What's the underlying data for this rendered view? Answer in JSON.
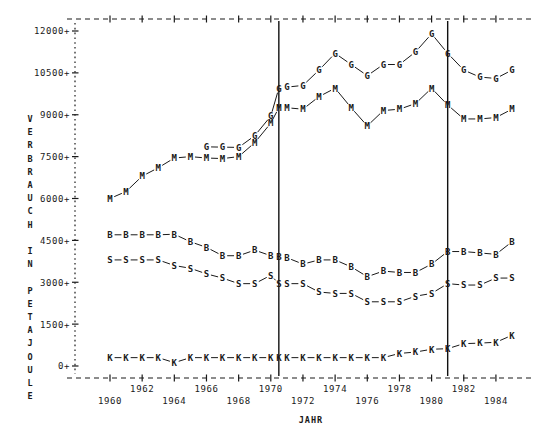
{
  "chart_data": {
    "type": "line",
    "title": "",
    "xlabel": "JAHR",
    "ylabel": "VERBRAUCH IN PETAJOULE",
    "xlim": [
      1959,
      1985.6
    ],
    "ylim": [
      0,
      12450
    ],
    "grid": false,
    "legend": "none",
    "marker_labels_as_series_keys": true,
    "y_ticks": [
      0,
      1500,
      3000,
      4500,
      6000,
      7500,
      9000,
      10500,
      12000
    ],
    "y_tick_labels": [
      "0+",
      "1500+",
      "3000+",
      "4500+",
      "6000+",
      "7500+",
      "9000+",
      "10500+",
      "12000+"
    ],
    "x_ticks": [
      1960,
      1961,
      1962,
      1963,
      1964,
      1965,
      1966,
      1967,
      1968,
      1969,
      1970,
      1971,
      1972,
      1973,
      1974,
      1975,
      1976,
      1977,
      1978,
      1979,
      1980,
      1981,
      1982,
      1983,
      1984,
      1985
    ],
    "x_tick_labels_upper": [
      {
        "year": 1962,
        "label": "1962"
      },
      {
        "year": 1966,
        "label": "1966"
      },
      {
        "year": 1970,
        "label": "1970"
      },
      {
        "year": 1974,
        "label": "1974"
      },
      {
        "year": 1978,
        "label": "1978"
      },
      {
        "year": 1982,
        "label": "1982"
      }
    ],
    "x_tick_labels_lower": [
      {
        "year": 1960,
        "label": "1960"
      },
      {
        "year": 1964,
        "label": "1964"
      },
      {
        "year": 1968,
        "label": "1968"
      },
      {
        "year": 1972,
        "label": "1972"
      },
      {
        "year": 1976,
        "label": "1976"
      },
      {
        "year": 1980,
        "label": "1980"
      },
      {
        "year": 1984,
        "label": "1984"
      }
    ],
    "reference_lines": [
      {
        "year": 1970.5,
        "label": ""
      },
      {
        "year": 1981.0,
        "label": ""
      }
    ],
    "series": [
      {
        "name": "G",
        "marker": "G",
        "x": [
          1966,
          1967,
          1968,
          1969,
          1970,
          1970.5,
          1971,
          1972,
          1973,
          1974,
          1975,
          1976,
          1977,
          1978,
          1979,
          1980,
          1981,
          1982,
          1983,
          1984,
          1985
        ],
        "values": [
          7850,
          7840,
          7830,
          8250,
          8950,
          9950,
          9990,
          10050,
          10600,
          11200,
          10800,
          10400,
          10800,
          10800,
          11250,
          11900,
          11200,
          10600,
          10350,
          10300,
          10600
        ]
      },
      {
        "name": "M",
        "marker": "M",
        "x": [
          1960,
          1961,
          1962,
          1963,
          1964,
          1965,
          1966,
          1967,
          1968,
          1969,
          1970,
          1970.5,
          1971,
          1972,
          1973,
          1974,
          1975,
          1976,
          1977,
          1978,
          1979,
          1980,
          1981,
          1982,
          1983,
          1984,
          1985
        ],
        "values": [
          6000,
          6250,
          6800,
          7100,
          7450,
          7500,
          7450,
          7430,
          7500,
          8000,
          8700,
          9250,
          9250,
          9200,
          9650,
          9950,
          9250,
          8600,
          9150,
          9200,
          9400,
          9950,
          9350,
          8850,
          8850,
          8900,
          9200
        ]
      },
      {
        "name": "B",
        "marker": "B",
        "x": [
          1960,
          1961,
          1962,
          1963,
          1964,
          1965,
          1966,
          1967,
          1968,
          1969,
          1970,
          1970.5,
          1971,
          1972,
          1973,
          1974,
          1975,
          1976,
          1977,
          1978,
          1979,
          1980,
          1981,
          1982,
          1983,
          1984,
          1985
        ],
        "values": [
          4700,
          4700,
          4700,
          4700,
          4720,
          4450,
          4250,
          3950,
          3950,
          4150,
          3950,
          3900,
          3880,
          3650,
          3800,
          3800,
          3550,
          3200,
          3400,
          3350,
          3350,
          3650,
          4100,
          4100,
          4050,
          4000,
          4450
        ]
      },
      {
        "name": "S",
        "marker": "S",
        "x": [
          1960,
          1961,
          1962,
          1963,
          1964,
          1965,
          1966,
          1967,
          1968,
          1969,
          1970,
          1970.5,
          1971,
          1972,
          1973,
          1974,
          1975,
          1976,
          1977,
          1978,
          1979,
          1980,
          1981,
          1982,
          1983,
          1984,
          1985
        ],
        "values": [
          3800,
          3800,
          3800,
          3800,
          3600,
          3500,
          3300,
          3150,
          2950,
          2950,
          3250,
          2950,
          2950,
          2950,
          2650,
          2600,
          2600,
          2300,
          2300,
          2300,
          2500,
          2600,
          2950,
          2900,
          2900,
          3150,
          3150
        ]
      },
      {
        "name": "K",
        "marker": "K",
        "x": [
          1960,
          1961,
          1962,
          1963,
          1964,
          1965,
          1966,
          1967,
          1968,
          1969,
          1970,
          1970.5,
          1971,
          1972,
          1973,
          1974,
          1975,
          1976,
          1977,
          1978,
          1979,
          1980,
          1981,
          1982,
          1983,
          1984,
          1985
        ],
        "values": [
          300,
          300,
          300,
          300,
          120,
          300,
          300,
          300,
          300,
          300,
          300,
          300,
          300,
          300,
          300,
          300,
          300,
          300,
          300,
          450,
          500,
          600,
          620,
          800,
          820,
          850,
          1100
        ]
      }
    ]
  },
  "axes": {
    "y_axis_label_text": "VERBRAUCH IN PETAJOULE",
    "x_axis_label_text": "JAHR"
  }
}
